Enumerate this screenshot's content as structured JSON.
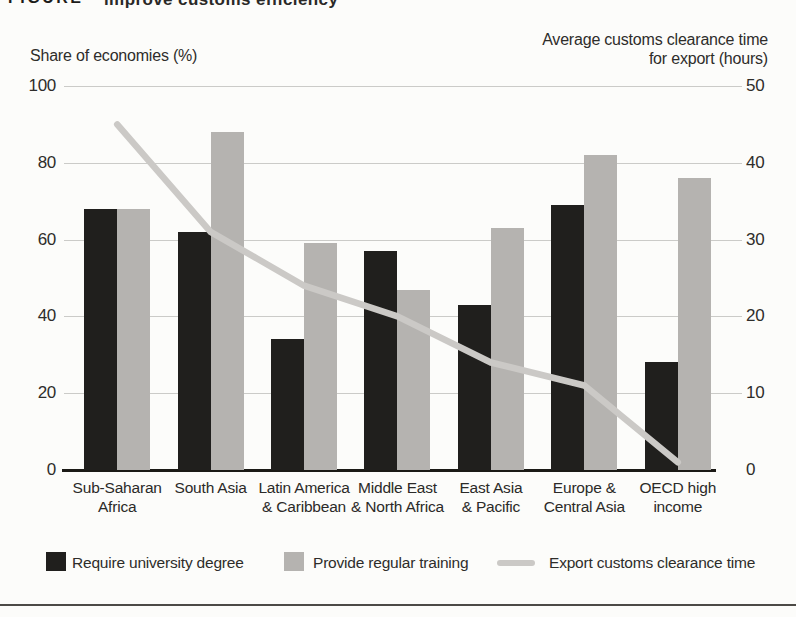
{
  "clipped_title": {
    "prefix": "FIGURE",
    "text": "improve customs efficiency"
  },
  "chart_data": {
    "type": "bar",
    "subtype": "grouped-bars-with-line",
    "categories": [
      "Sub-Saharan\nAfrica",
      "South Asia",
      "Latin America\n& Caribbean",
      "Middle East\n& North Africa",
      "East Asia\n& Pacific",
      "Europe &\nCentral Asia",
      "OECD high\nincome"
    ],
    "series": [
      {
        "name": "Require university degree",
        "type": "bar",
        "axis": "left",
        "color": "#201f1d",
        "values": [
          68,
          62,
          34,
          57,
          43,
          69,
          28
        ]
      },
      {
        "name": "Provide regular training",
        "type": "bar",
        "axis": "left",
        "color": "#b5b3b0",
        "values": [
          68,
          88,
          59,
          47,
          63,
          82,
          76
        ]
      },
      {
        "name": "Export customs clearance time",
        "type": "line",
        "axis": "right",
        "color": "#cbc9c6",
        "values": [
          45,
          31,
          24,
          20,
          14,
          11,
          1
        ]
      }
    ],
    "left_axis": {
      "title": "Share of economies (%)",
      "min": 0,
      "max": 100,
      "ticks": [
        100,
        80,
        60,
        40,
        20,
        0
      ]
    },
    "right_axis": {
      "title": "Average customs clearance time for export (hours)",
      "min": 0,
      "max": 50,
      "ticks": [
        50,
        40,
        30,
        20,
        10,
        0
      ]
    },
    "grid": true,
    "legend_position": "bottom"
  },
  "theme": {
    "background": "#fcfcfa",
    "text": "#2e2d2a",
    "gridline": "#cbcbc8",
    "baseline": "#1b1a16",
    "bottom_rule": "#4c4a46"
  }
}
